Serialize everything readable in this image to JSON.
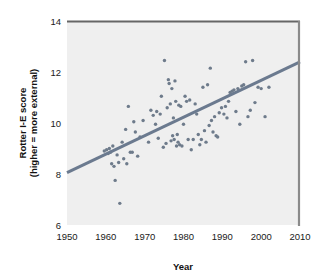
{
  "chart_data": {
    "type": "scatter",
    "title": "",
    "xlabel": "Year",
    "ylabel": "Rotter I-E score (higher = more external)",
    "ylabel_line1": "Rotter I-E score",
    "ylabel_line2": "(higher = more external)",
    "xlim": [
      1950,
      2010
    ],
    "ylim": [
      6,
      14
    ],
    "xticks": [
      1950,
      1960,
      1970,
      1980,
      1990,
      2000,
      2010
    ],
    "xtick_labels": [
      "1950",
      "1960",
      "1970",
      "1980",
      "1990",
      "2000",
      "2010"
    ],
    "yticks": [
      6,
      8,
      10,
      12,
      14
    ],
    "ytick_labels": [
      "6",
      "8",
      "10",
      "12",
      "14"
    ],
    "grid": false,
    "legend": null,
    "point_color": "#6e7b8b",
    "line_color": "#6b7a8f",
    "plot_background": "#efefef",
    "axis_color": "#555555",
    "trendline": {
      "type": "linear",
      "x_start": 1950,
      "y_start": 8.05,
      "x_end": 2010,
      "y_end": 12.4,
      "slope": 0.0725,
      "intercept": -133.3
    },
    "points": [
      [
        1959.6,
        8.9
      ],
      [
        1960.2,
        8.95
      ],
      [
        1960.6,
        8.8
      ],
      [
        1960.9,
        9.0
      ],
      [
        1961.2,
        8.85
      ],
      [
        1961.5,
        8.4
      ],
      [
        1961.8,
        9.1
      ],
      [
        1962.1,
        8.3
      ],
      [
        1962.4,
        7.75
      ],
      [
        1962.9,
        8.75
      ],
      [
        1963.3,
        8.45
      ],
      [
        1963.6,
        6.85
      ],
      [
        1964.2,
        9.25
      ],
      [
        1964.6,
        8.6
      ],
      [
        1965.1,
        9.75
      ],
      [
        1965.4,
        8.4
      ],
      [
        1965.8,
        10.65
      ],
      [
        1966.3,
        8.85
      ],
      [
        1966.8,
        8.85
      ],
      [
        1967.2,
        10.05
      ],
      [
        1967.6,
        9.65
      ],
      [
        1968.2,
        8.7
      ],
      [
        1968.8,
        9.45
      ],
      [
        1969.6,
        10.1
      ],
      [
        1971.0,
        9.25
      ],
      [
        1971.6,
        10.5
      ],
      [
        1972.2,
        10.3
      ],
      [
        1972.8,
        9.95
      ],
      [
        1973.1,
        10.45
      ],
      [
        1973.5,
        9.4
      ],
      [
        1974.0,
        10.35
      ],
      [
        1974.3,
        11.05
      ],
      [
        1974.8,
        9.05
      ],
      [
        1975.1,
        12.45
      ],
      [
        1975.5,
        9.2
      ],
      [
        1975.8,
        10.6
      ],
      [
        1976.1,
        11.7
      ],
      [
        1976.3,
        11.55
      ],
      [
        1976.6,
        10.75
      ],
      [
        1976.8,
        9.3
      ],
      [
        1977.0,
        11.35
      ],
      [
        1977.2,
        9.5
      ],
      [
        1977.4,
        10.2
      ],
      [
        1977.6,
        9.35
      ],
      [
        1977.8,
        11.65
      ],
      [
        1978.0,
        10.85
      ],
      [
        1978.2,
        9.1
      ],
      [
        1978.4,
        9.55
      ],
      [
        1978.6,
        9.25
      ],
      [
        1978.8,
        10.7
      ],
      [
        1979.0,
        9.15
      ],
      [
        1979.3,
        10.65
      ],
      [
        1979.6,
        9.1
      ],
      [
        1980.0,
        9.95
      ],
      [
        1980.4,
        11.05
      ],
      [
        1980.8,
        10.85
      ],
      [
        1981.2,
        9.35
      ],
      [
        1981.6,
        10.9
      ],
      [
        1982.0,
        8.95
      ],
      [
        1982.5,
        9.35
      ],
      [
        1983.0,
        10.75
      ],
      [
        1983.4,
        10.35
      ],
      [
        1983.8,
        9.55
      ],
      [
        1984.2,
        9.15
      ],
      [
        1984.6,
        9.35
      ],
      [
        1985.0,
        11.4
      ],
      [
        1985.4,
        9.7
      ],
      [
        1985.8,
        9.25
      ],
      [
        1986.2,
        11.5
      ],
      [
        1986.6,
        9.9
      ],
      [
        1986.9,
        12.15
      ],
      [
        1987.2,
        10.1
      ],
      [
        1987.6,
        9.65
      ],
      [
        1988.0,
        10.25
      ],
      [
        1988.4,
        9.5
      ],
      [
        1988.8,
        9.45
      ],
      [
        1989.2,
        10.4
      ],
      [
        1989.8,
        10.6
      ],
      [
        1990.4,
        10.35
      ],
      [
        1990.8,
        10.65
      ],
      [
        1991.2,
        10.2
      ],
      [
        1991.6,
        10.85
      ],
      [
        1992.0,
        11.2
      ],
      [
        1992.5,
        11.25
      ],
      [
        1993.0,
        11.3
      ],
      [
        1993.5,
        10.45
      ],
      [
        1994.0,
        11.35
      ],
      [
        1994.5,
        9.95
      ],
      [
        1995.0,
        11.45
      ],
      [
        1995.5,
        11.5
      ],
      [
        1996.0,
        12.4
      ],
      [
        1996.6,
        10.25
      ],
      [
        1997.2,
        10.5
      ],
      [
        1997.8,
        12.45
      ],
      [
        1998.4,
        10.8
      ],
      [
        1999.2,
        11.4
      ],
      [
        2000.0,
        11.35
      ],
      [
        2001.0,
        10.25
      ],
      [
        2002.0,
        11.4
      ]
    ]
  }
}
